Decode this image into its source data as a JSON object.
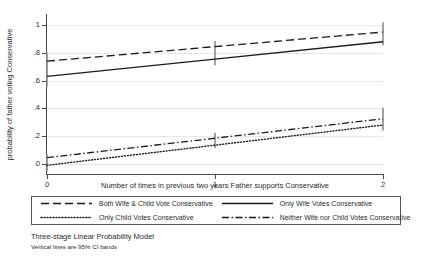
{
  "chart_data": {
    "type": "line",
    "title": "",
    "xlabel": "Number of times in previous two years Father supports Conservative",
    "ylabel": "probability of father voting Conservative",
    "x": [
      0,
      1,
      2
    ],
    "xticklabels": [
      "0",
      "1",
      "2"
    ],
    "xlim": [
      0,
      2
    ],
    "ylim": [
      -0.08,
      1.08
    ],
    "yticks": [
      0,
      0.2,
      0.4,
      0.6,
      0.8,
      1
    ],
    "yticklabels": [
      "0",
      ".2",
      ".4",
      ".6",
      ".8",
      "1"
    ],
    "grid": true,
    "grid_axis": "y",
    "legend_position": "below-axes",
    "series": [
      {
        "name": "Both Wife & Child Vote Conservative",
        "style": "dashed",
        "values": [
          0.74,
          0.845,
          0.95
        ],
        "ci_low": [
          0.74,
          0.845,
          0.95
        ],
        "ci_high": [
          0.74,
          0.845,
          0.95
        ]
      },
      {
        "name": "Only Wife Votes Conservative",
        "style": "solid",
        "values": [
          0.63,
          0.755,
          0.88
        ],
        "ci_low": [
          0.63,
          0.755,
          0.88
        ],
        "ci_high": [
          0.63,
          0.755,
          0.88
        ]
      },
      {
        "name": "Only Child Votes Conservative",
        "style": "dotted",
        "values": [
          -0.01,
          0.135,
          0.28
        ],
        "ci_low": [
          -0.01,
          0.135,
          0.28
        ],
        "ci_high": [
          -0.01,
          0.135,
          0.28
        ]
      },
      {
        "name": "Neither Wife nor Child Votes Conservative",
        "style": "dash-dot",
        "values": [
          0.045,
          0.185,
          0.325
        ],
        "ci_low": [
          0.045,
          0.185,
          0.325
        ],
        "ci_high": [
          0.045,
          0.185,
          0.325
        ]
      }
    ],
    "ci_bands": [
      {
        "x": 0,
        "low": 0.555,
        "high": 0.8
      },
      {
        "x": 0,
        "low": -0.055,
        "high": 0.07
      },
      {
        "x": 1,
        "low": 0.71,
        "high": 0.885
      },
      {
        "x": 1,
        "low": 0.115,
        "high": 0.225
      },
      {
        "x": 2,
        "low": 0.855,
        "high": 1.02
      },
      {
        "x": 2,
        "low": 0.24,
        "high": 0.405
      }
    ],
    "ci_note": "Vertical lines are 95% CI bands",
    "line_color": "#1a1a1a",
    "ci_color": "#8c8c8c",
    "grid_color": "#e6e6e6",
    "axis_color": "#4a4a4a"
  },
  "legend": {
    "entries": [
      {
        "label": "Both Wife & Child Vote Conservative",
        "style": "dashed"
      },
      {
        "label": "Only Wife Votes Conservative",
        "style": "solid"
      },
      {
        "label": "Only Child Votes Conservative",
        "style": "dotted"
      },
      {
        "label": "Neither Wife nor Child Votes Conservative",
        "style": "dash-dot"
      }
    ]
  },
  "caption": {
    "main": "Three-stage Linear Probability Model",
    "note": "Vertical lines are 95% CI bands"
  }
}
